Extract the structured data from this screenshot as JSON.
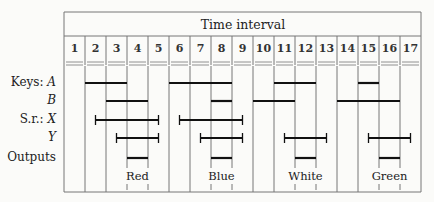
{
  "header": {
    "title": "Time interval"
  },
  "columns": [
    "1",
    "2",
    "3",
    "4",
    "5",
    "6",
    "7",
    "8",
    "9",
    "10",
    "11",
    "12",
    "13",
    "14",
    "15",
    "16",
    "17"
  ],
  "rows": [
    {
      "prefix": "Keys:",
      "name": "A"
    },
    {
      "prefix": "",
      "name": "B"
    },
    {
      "prefix": "S.r.:",
      "name": "X"
    },
    {
      "prefix": "",
      "name": "Y"
    },
    {
      "prefix": "Outputs",
      "name": ""
    }
  ],
  "outputs": [
    "Red",
    "Blue",
    "White",
    "Green"
  ],
  "timing": {
    "A": [
      [
        2,
        3
      ],
      [
        6,
        8
      ],
      [
        11,
        12
      ],
      [
        15,
        15
      ]
    ],
    "B": [
      [
        3,
        4
      ],
      [
        8,
        8
      ],
      [
        10,
        11
      ],
      [
        14,
        16
      ]
    ],
    "X": [
      [
        2.5,
        5.5
      ],
      [
        6.5,
        9.5
      ]
    ],
    "Y": [
      [
        3.5,
        5.5
      ],
      [
        7.5,
        9.5
      ],
      [
        11.5,
        13.5
      ],
      [
        15.5,
        17.5
      ]
    ],
    "Outputs": [
      [
        4,
        4
      ],
      [
        8,
        8
      ],
      [
        12,
        12
      ],
      [
        16,
        16
      ]
    ]
  },
  "colors": {
    "line": "#111111",
    "grid": "#777777",
    "background": "#fbfbf9"
  }
}
